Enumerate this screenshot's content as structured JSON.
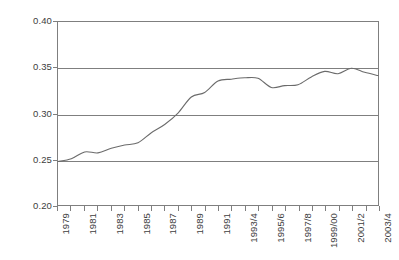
{
  "chart_data": {
    "type": "line",
    "title": "",
    "subtitle": "",
    "xlabel": "",
    "ylabel": "",
    "grid": true,
    "legend": "none",
    "ylim": [
      0.2,
      0.4
    ],
    "yticks": [
      "0.20",
      "0.25",
      "0.30",
      "0.35",
      "0.40"
    ],
    "ytick_values": [
      0.2,
      0.25,
      0.3,
      0.35,
      0.4
    ],
    "categories": [
      "1979",
      "1980",
      "1981",
      "1982",
      "1983",
      "1984",
      "1985",
      "1986",
      "1987",
      "1988",
      "1989",
      "1990",
      "1991",
      "1992/3",
      "1993/4",
      "1994/5",
      "1995/6",
      "1996/7",
      "1997/8",
      "1998/9",
      "1999/00",
      "2000/1",
      "2001/2",
      "2002/3",
      "2003/4"
    ],
    "xtick_labels": [
      "1979",
      "",
      "1981",
      "",
      "1983",
      "",
      "1985",
      "",
      "1987",
      "",
      "1989",
      "",
      "1991",
      "",
      "1993/4",
      "",
      "1995/6",
      "",
      "1997/8",
      "",
      "1999/00",
      "",
      "2001/2",
      "",
      "2003/4"
    ],
    "values": [
      0.2475,
      0.2505,
      0.258,
      0.257,
      0.262,
      0.2655,
      0.268,
      0.279,
      0.288,
      0.3005,
      0.318,
      0.323,
      0.3355,
      0.3375,
      0.339,
      0.3385,
      0.3285,
      0.3305,
      0.3315,
      0.34,
      0.346,
      0.3435,
      0.3495,
      0.345,
      0.3415
    ],
    "series": [
      {
        "name": "share",
        "values": [
          0.2475,
          0.2505,
          0.258,
          0.257,
          0.262,
          0.2655,
          0.268,
          0.279,
          0.288,
          0.3005,
          0.318,
          0.323,
          0.3355,
          0.3375,
          0.339,
          0.3385,
          0.3285,
          0.3305,
          0.3315,
          0.34,
          0.346,
          0.3435,
          0.3495,
          0.345,
          0.3415
        ],
        "color": "#6b6b6b"
      }
    ],
    "annotations": [
      {
        "label": "Thatcher",
        "start_index": 0,
        "end_index": 11.5
      },
      {
        "label": "Major",
        "start_index": 11.5,
        "end_index": 17.5
      },
      {
        "label": "Blair",
        "start_index": 17.5,
        "end_index": 24
      }
    ],
    "colors": {
      "line": "#6b6b6b",
      "axis": "#7f7f7f",
      "grid": "#7f7f7f",
      "text": "#3d3d3d",
      "background": "#ffffff"
    }
  }
}
